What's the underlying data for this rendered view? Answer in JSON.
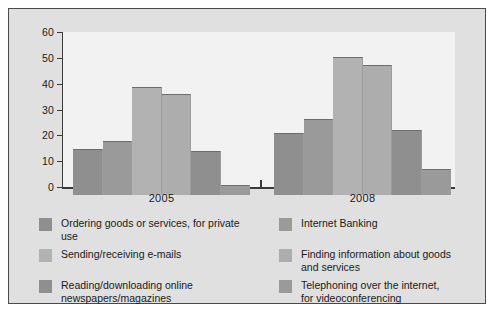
{
  "figure": {
    "background": "#e0e0e0",
    "border_color": "#4a4a4a",
    "plot_background": "#f2f2f2",
    "axis_color": "#3a3a3a"
  },
  "chart_data": {
    "type": "bar",
    "title": "",
    "subtitle": "",
    "xlabel": "",
    "ylabel": "",
    "categories": [
      "2005",
      "2008"
    ],
    "ylim": [
      0,
      60
    ],
    "yticks": [
      0,
      10,
      20,
      30,
      40,
      50,
      60
    ],
    "ytick_labels": [
      "0",
      "10",
      "20",
      "30",
      "40",
      "50",
      "60"
    ],
    "grid": false,
    "legend_position": "bottom",
    "series": [
      {
        "name": "Ordering goods or services, for private use",
        "color": "#8f8f8f",
        "values": [
          18,
          24
        ]
      },
      {
        "name": "Internet Banking",
        "color": "#9a9a9a",
        "values": [
          21,
          29.5
        ]
      },
      {
        "name": "Sending/receiving e-mails",
        "color": "#b2b2b2",
        "values": [
          42,
          53.5
        ]
      },
      {
        "name": "Finding information about goods and services",
        "color": "#adadad",
        "values": [
          39,
          50.5
        ]
      },
      {
        "name": "Reading/downloading online newspapers/magazines",
        "color": "#8f8f8f",
        "values": [
          17,
          25
        ]
      },
      {
        "name": "Telephoning over the internet, for videoconferencing",
        "color": "#9a9a9a",
        "values": [
          4,
          10
        ]
      }
    ]
  },
  "axis": {
    "tick_0": "0",
    "tick_10": "10",
    "tick_20": "20",
    "tick_30": "30",
    "tick_40": "40",
    "tick_50": "50",
    "tick_60": "60"
  },
  "groups": {
    "group_1_label": "2005",
    "group_2_label": "2008"
  },
  "legend": {
    "items": [
      {
        "label": "Ordering goods or services, for private use",
        "color": "#8f8f8f"
      },
      {
        "label": "Sending/receiving e-mails",
        "color": "#b2b2b2"
      },
      {
        "label": "Reading/downloading online\nnewspapers/magazines",
        "color": "#8f8f8f"
      },
      {
        "label": "Internet Banking",
        "color": "#9a9a9a"
      },
      {
        "label": "Finding information about goods\nand services",
        "color": "#adadad"
      },
      {
        "label": "Telephoning over the internet,\nfor videoconferencing",
        "color": "#9a9a9a"
      }
    ]
  }
}
